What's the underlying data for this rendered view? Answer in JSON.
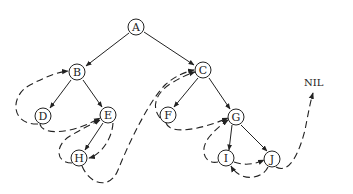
{
  "diagram": {
    "type": "threaded-binary-tree",
    "nodes": [
      {
        "id": "A",
        "label": "A",
        "x": 136,
        "y": 27
      },
      {
        "id": "B",
        "label": "B",
        "x": 77,
        "y": 72
      },
      {
        "id": "C",
        "label": "C",
        "x": 203,
        "y": 70
      },
      {
        "id": "D",
        "label": "D",
        "x": 43,
        "y": 116
      },
      {
        "id": "E",
        "label": "E",
        "x": 108,
        "y": 115
      },
      {
        "id": "F",
        "label": "F",
        "x": 168,
        "y": 115
      },
      {
        "id": "G",
        "label": "G",
        "x": 236,
        "y": 117
      },
      {
        "id": "H",
        "label": "H",
        "x": 79,
        "y": 158
      },
      {
        "id": "I",
        "label": "I",
        "x": 226,
        "y": 158
      },
      {
        "id": "J",
        "label": "J",
        "x": 272,
        "y": 159
      }
    ],
    "edges": [
      [
        "A",
        "B"
      ],
      [
        "A",
        "C"
      ],
      [
        "B",
        "D"
      ],
      [
        "B",
        "E"
      ],
      [
        "E",
        "H"
      ],
      [
        "C",
        "F"
      ],
      [
        "C",
        "G"
      ],
      [
        "G",
        "I"
      ],
      [
        "G",
        "J"
      ]
    ],
    "threads": [
      {
        "from": "D",
        "to": "B"
      },
      {
        "from": "D",
        "to": "E"
      },
      {
        "from": "H",
        "to": "E"
      },
      {
        "from": "H",
        "to": "C"
      },
      {
        "from": "F",
        "to": "C"
      },
      {
        "from": "F",
        "to": "G"
      },
      {
        "from": "I",
        "to": "G"
      },
      {
        "from": "I",
        "to": "J"
      },
      {
        "from": "J",
        "to": "I"
      },
      {
        "from": "J",
        "to": "NIL"
      }
    ],
    "nil_label": "NIL"
  }
}
